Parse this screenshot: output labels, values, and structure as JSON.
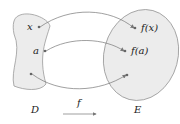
{
  "diagram": {
    "type": "function-mapping",
    "domain_set": {
      "label": "D",
      "points": [
        "x",
        "a",
        ""
      ]
    },
    "codomain_set": {
      "label": "E",
      "points": [
        "f(x)",
        "f(a)",
        ""
      ]
    },
    "function_label": "f",
    "mappings": [
      {
        "from": "x",
        "to": "f(x)"
      },
      {
        "from": "a",
        "to": "f(a)"
      },
      {
        "from": "",
        "to": ""
      }
    ],
    "colors": {
      "set_fill": "#ececec",
      "set_stroke": "#999999",
      "arrow": "#777777",
      "text": "#222222"
    }
  }
}
